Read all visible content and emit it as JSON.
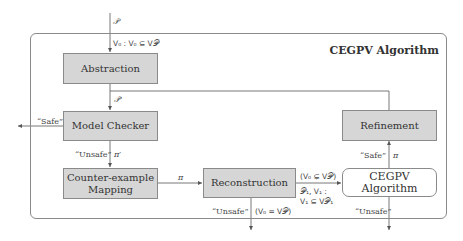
{
  "title": "CEGPV Algorithm",
  "nodes": {
    "abstraction": "Abstraction",
    "model_checker": "Model Checker",
    "counterexample_mapping_line1": "Counter-example",
    "counterexample_mapping_line2": "Mapping",
    "reconstruction": "Reconstruction",
    "refinement": "Refinement",
    "cegpv_inner": "CEGPV Algorithm"
  },
  "edge_labels": {
    "input_program": "𝒫",
    "initial_vars": "V₀ : V₀ ⊆ V𝒫",
    "abstract_program": "𝒫′",
    "safe_out": "“Safe”",
    "unsafe_mc": "“Unsafe”",
    "abstract_cex": "π′",
    "cex": "π",
    "partial_cond": "(V₀ ⊊ V𝒫)",
    "sub_problem_1": "𝒫₁, V₁ :",
    "sub_problem_2": "V₁ ⊆ V𝒫₁",
    "unsafe_recon": "“Unsafe”",
    "full_cond": "(V₀ = V𝒫)",
    "safe_inner": "“Safe”",
    "inner_cex": "π",
    "unsafe_inner": "“Unsafe”"
  },
  "colors": {
    "box_fill": "#d6d6d6",
    "box_border": "#8a8a8a",
    "line": "#555555"
  }
}
